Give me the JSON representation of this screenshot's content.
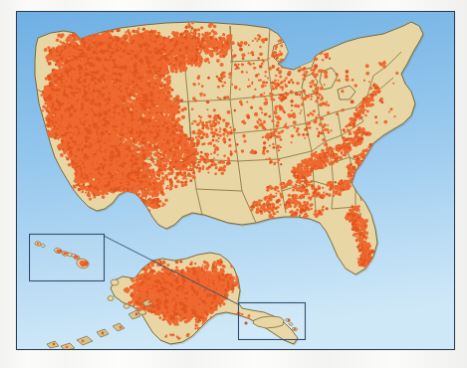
{
  "figure": {
    "kind": "dot-density-map",
    "description": "Dot density map of the United States with Alaska, Hawaii and Puerto Rico insets. Each dot marks one occurrence; density is heaviest across the Western states and sparse across the Midwest, Great Plains and Northeast."
  },
  "colors": {
    "ocean_top": "#6fb0e4",
    "ocean_mid": "#96c8ee",
    "ocean_bottom": "#cfe8f8",
    "land": "#e8d7a4",
    "land_shadow": "#d8c48c",
    "dot": "#ef6a31",
    "dot_dark": "#e2561f",
    "state_border": "#8a7540",
    "coast_outline": "#7d6a3a",
    "frame_border": "#2f4257",
    "inset_border": "#33506e",
    "page": "#f6f6f4"
  },
  "frame": {
    "x": 16,
    "y": 11,
    "width": 439,
    "height": 339,
    "border_width": 1.5
  },
  "insets": [
    {
      "name": "hawaii",
      "label": "Hawaii inset",
      "x": 28,
      "y": 234,
      "width": 75,
      "height": 47
    },
    {
      "name": "puerto-rico",
      "label": "Puerto Rico inset",
      "x": 238,
      "y": 303,
      "width": 67,
      "height": 37
    }
  ],
  "leader_line": {
    "name": "puerto-rico-leader",
    "x1": 103,
    "y1": 236,
    "x2": 238,
    "y2": 305
  },
  "regions": [
    {
      "name": "pacific-west",
      "label": "Pacific West",
      "density": "very-high"
    },
    {
      "name": "mountain-west",
      "label": "Mountain West",
      "density": "very-high"
    },
    {
      "name": "great-plains",
      "label": "Great Plains",
      "density": "low"
    },
    {
      "name": "midwest",
      "label": "Midwest",
      "density": "low"
    },
    {
      "name": "southeast",
      "label": "Southeast",
      "density": "medium-low"
    },
    {
      "name": "northeast",
      "label": "Northeast",
      "density": "low"
    },
    {
      "name": "florida",
      "label": "Florida",
      "density": "medium"
    },
    {
      "name": "alaska",
      "label": "Alaska",
      "density": "very-high"
    },
    {
      "name": "hawaii",
      "label": "Hawaii",
      "density": "medium"
    },
    {
      "name": "puerto-rico",
      "label": "Puerto Rico",
      "density": "very-low"
    }
  ],
  "chart_data": {
    "type": "scatter",
    "xlabel": "",
    "ylabel": "",
    "legend": [],
    "grid": false,
    "note": "Relative dot counts by region as read from the plate; each unit is an approximate cluster count, not an exact tally.",
    "categories": [
      "Pacific West",
      "Mountain West",
      "Southwest",
      "Great Plains",
      "Midwest",
      "Southeast",
      "Northeast",
      "Florida",
      "Alaska",
      "Hawaii",
      "Puerto Rico"
    ],
    "values": [
      260,
      240,
      90,
      55,
      70,
      110,
      45,
      40,
      150,
      14,
      3
    ]
  }
}
